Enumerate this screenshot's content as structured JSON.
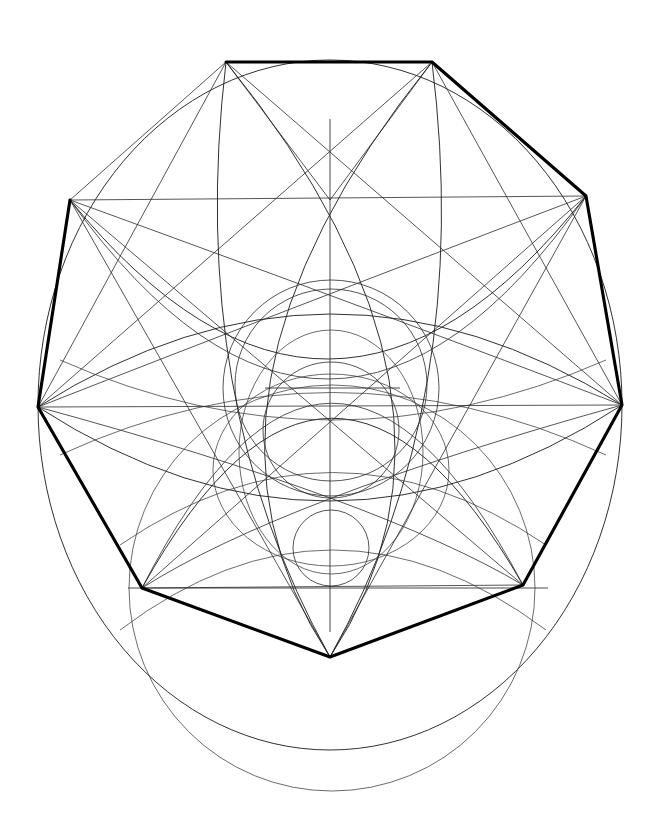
{
  "figure": {
    "width": 664,
    "height": 835,
    "background_color": "#ffffff",
    "ink_color": "#000000",
    "line_weights": {
      "thin": 0.9,
      "thinner": 0.8,
      "faint": 0.75,
      "heavy": 3.1
    }
  },
  "chart_data": {
    "type": "scatter",
    "xlabel": "",
    "ylabel": "",
    "xlim": [
      0,
      664
    ],
    "ylim": [
      0,
      835
    ],
    "grid": false,
    "legend": "none",
    "annotations": [
      "Large primary circle centred at (330,405) radius 293",
      "Regular octagon inscribed, thickened on alternating edges",
      "Pair of large vesica arcs crossing the centre",
      "Three concentric inner circles about the vertical axis",
      "Large secondary circle tangent below, centre (332,588) radius 203",
      "Vertical centre axis from y=119 to y=632",
      "Horizontal chord at y=588 from x=128 to x=548",
      "Short horizontal chord at y=388 from x=265 to x=400"
    ],
    "primary_circle": {
      "cx": 330,
      "cy": 405,
      "r": 293
    },
    "bottom_circle": {
      "cx": 332,
      "cy": 588,
      "r": 203
    },
    "inner_circles": [
      {
        "cx": 331,
        "cy": 388,
        "r": 108
      },
      {
        "cx": 331,
        "cy": 385,
        "r": 96
      },
      {
        "cx": 331,
        "cy": 430,
        "r": 68
      },
      {
        "cx": 331,
        "cy": 548,
        "r": 38
      }
    ],
    "octagon_vertices": [
      {
        "name": "top-left",
        "x": 226,
        "y": 62
      },
      {
        "name": "top-right",
        "x": 432,
        "y": 62
      },
      {
        "name": "right-upper",
        "x": 586,
        "y": 196
      },
      {
        "name": "right",
        "x": 622,
        "y": 405
      },
      {
        "name": "right-lower",
        "x": 523,
        "y": 585
      },
      {
        "name": "bottom",
        "x": 330,
        "y": 657
      },
      {
        "name": "left-lower",
        "x": 142,
        "y": 588
      },
      {
        "name": "left",
        "x": 38,
        "y": 407
      },
      {
        "name": "left-upper",
        "x": 70,
        "y": 200
      }
    ],
    "heavy_edges": [
      {
        "from": "top-left",
        "to": "top-right"
      },
      {
        "from": "top-right",
        "to": "right-upper"
      },
      {
        "from": "right-upper",
        "to": "right"
      },
      {
        "from": "left-upper",
        "to": "top-left"
      },
      {
        "from": "left",
        "to": "left-upper"
      },
      {
        "from": "left",
        "to": "left-lower"
      },
      {
        "from": "left-lower",
        "to": "bottom"
      },
      {
        "from": "bottom",
        "to": "right-lower"
      },
      {
        "from": "right-lower",
        "to": "right"
      }
    ],
    "reference_lines": [
      {
        "name": "vertical-axis",
        "x1": 330,
        "y1": 119,
        "x2": 330,
        "y2": 632
      },
      {
        "name": "lower-horizontal",
        "x1": 128,
        "y1": 588,
        "x2": 548,
        "y2": 588
      },
      {
        "name": "mid-horizontal",
        "x1": 265,
        "y1": 388,
        "x2": 400,
        "y2": 388
      }
    ],
    "values": [
      62,
      196,
      405,
      585,
      657,
      588,
      407,
      200
    ],
    "categories": [
      "top-left",
      "top-right",
      "right-upper",
      "right",
      "right-lower",
      "bottom",
      "left-lower",
      "left"
    ]
  }
}
